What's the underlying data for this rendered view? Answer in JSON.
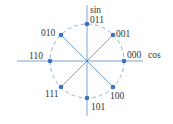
{
  "diagram": {
    "axes": {
      "x_label": "cos",
      "y_label": "sin"
    },
    "colors": {
      "axis": "#7aa6d6",
      "point": "#3a73c0",
      "circle": "#8fb3dc",
      "text": "#333333"
    },
    "points": [
      {
        "label": "000",
        "angle_deg": 0
      },
      {
        "label": "001",
        "angle_deg": 45
      },
      {
        "label": "011",
        "angle_deg": 90
      },
      {
        "label": "010",
        "angle_deg": 135
      },
      {
        "label": "110",
        "angle_deg": 180
      },
      {
        "label": "111",
        "angle_deg": 225
      },
      {
        "label": "101",
        "angle_deg": 270
      },
      {
        "label": "100",
        "angle_deg": 315
      }
    ]
  }
}
